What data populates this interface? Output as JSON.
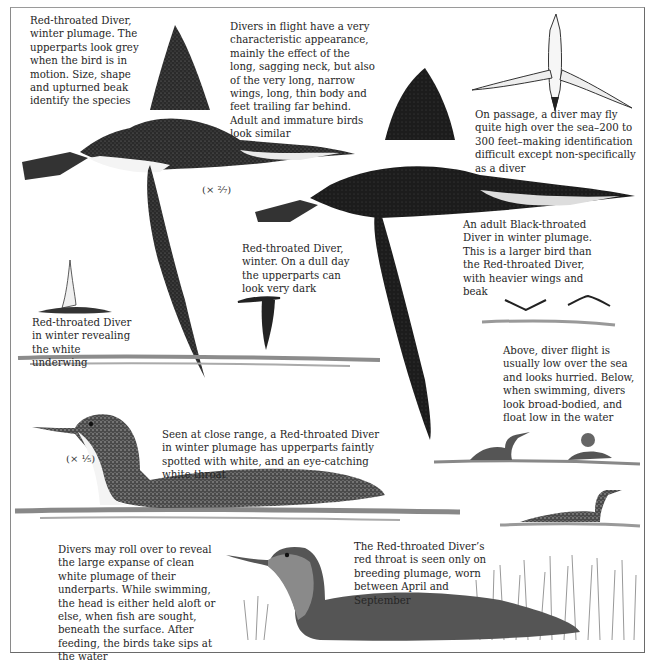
{
  "page": {
    "type": "field-guide-illustration-plate"
  },
  "captions": {
    "red_throated_winter": "Red-throated Diver, winter plumage. The upperparts look grey when the bird is in motion. Size, shape and upturned beak identify the species",
    "flight_appearance": "Divers in flight have a very characteristic appearance, mainly the effect of the long, sagging neck, but also of the very long, narrow wings, long, thin body and feet trailing far behind. Adult and immature birds look similar",
    "on_passage": "On passage, a diver may fly quite high over the sea–200 to 300 feet–making identification difficult except non-specifically as a diver",
    "black_throated_adult": "An adult Black-throated Diver in winter plumage. This is a larger bird than the Red-throated Diver, with heavier wings and beak",
    "red_throated_dull_day": "Red-throated Diver, winter. On a dull day the upperparts can look very dark",
    "white_underwing": "Red-throated Diver in winter revealing the white underwing",
    "flight_low": "Above, diver flight is usually low over the sea and looks hurried. Below, when swimming, divers look broad-bodied, and float low in the water",
    "close_range": "Seen at close range, a Red-throated Diver in winter plumage has upperparts faintly spotted with white, and an eye-catching white throat",
    "roll_over": "Divers may roll over to reveal the large expanse of clean white plumage of their underparts. While swimming, the head is either held aloft or else, when fish are sought, beneath the surface. After feeding, the birds take sips at the water",
    "breeding_throat": "The Red-throated Diver’s red throat is seen only on breeding plumage, worn between April and September"
  },
  "scales": {
    "flight_scale": "(× ²⁄₇)",
    "swim_scale": "(× ¹⁄₅)"
  },
  "illustrations": [
    {
      "name": "red-throated-diver-flying-large"
    },
    {
      "name": "black-throated-diver-flying"
    },
    {
      "name": "diver-high-passage-underside"
    },
    {
      "name": "diver-banking-white-underwing"
    },
    {
      "name": "red-throated-diver-dark-flight"
    },
    {
      "name": "diver-low-flight-silhouettes"
    },
    {
      "name": "red-throated-diver-swimming-winter"
    },
    {
      "name": "divers-swimming-group"
    },
    {
      "name": "red-throated-diver-breeding-reeds"
    }
  ],
  "colors": {
    "ink": "#262626",
    "plumage_dark": "#1f1f1f",
    "plumage_mid": "#555555",
    "water": "#8c8c8c",
    "frame": "#7a7a7a"
  }
}
